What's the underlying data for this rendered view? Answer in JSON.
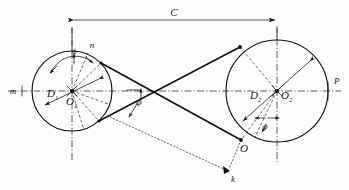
{
  "figure": {
    "type": "crossed-belt-drive-diagram",
    "background_color": "#fdfdfc",
    "line_color": "#111111"
  },
  "labels": {
    "center_distance": "C",
    "diameter_small": "D",
    "diameter_small_sub": "1",
    "diameter_large": "D",
    "diameter_large_sub": "2",
    "center_small": "O",
    "center_small_sub": "1",
    "center_large": "O",
    "center_large_sub": "2",
    "point_m": "m",
    "point_n": "n",
    "point_p": "P",
    "point_o": "O",
    "point_k": "k",
    "angle_phi_center": "ϕ",
    "angle_phi_small": "ϕ",
    "angle_phi_large": "ϕ"
  },
  "geometry": {
    "pulley_small": {
      "cx": 72,
      "cy": 91,
      "r": 40
    },
    "pulley_large": {
      "cx": 277,
      "cy": 91,
      "r": 51
    },
    "crossing_point": {
      "x": 158,
      "y": 94
    },
    "dimension_line_y": 20,
    "axis_y": 91,
    "point_k": {
      "x": 228,
      "y": 172
    },
    "point_o_tangent": {
      "x": 241,
      "y": 140
    }
  }
}
